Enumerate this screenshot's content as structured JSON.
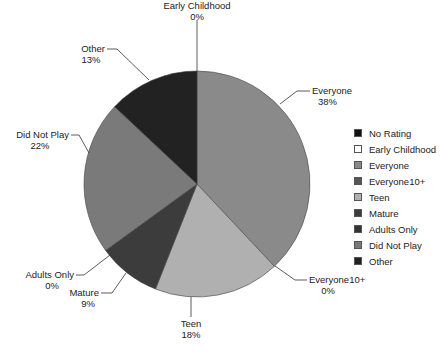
{
  "chart_data": {
    "type": "pie",
    "title": "",
    "categories": [
      "No Rating",
      "Early Childhood",
      "Everyone",
      "Everyone10+",
      "Teen",
      "Mature",
      "Adults Only",
      "Did Not Play",
      "Other"
    ],
    "values": [
      0,
      0,
      38,
      0,
      18,
      9,
      0,
      22,
      13
    ],
    "unit": "%",
    "start_angle": "top (12 o'clock), clockwise",
    "colors": [
      "#111111",
      "#ffffff",
      "#8a8a8a",
      "#555555",
      "#b0b0b0",
      "#3c3c3c",
      "#333333",
      "#7a7a7a",
      "#222222"
    ],
    "legend_position": "right",
    "slice_labels": [
      {
        "name": "Early Childhood",
        "pct": "0%"
      },
      {
        "name": "Everyone",
        "pct": "38%"
      },
      {
        "name": "Everyone10+",
        "pct": "0%"
      },
      {
        "name": "Teen",
        "pct": "18%"
      },
      {
        "name": "Mature",
        "pct": "9%"
      },
      {
        "name": "Adults Only",
        "pct": "0%"
      },
      {
        "name": "Did Not Play",
        "pct": "22%"
      },
      {
        "name": "Other",
        "pct": "13%"
      }
    ]
  },
  "legend": {
    "items": [
      {
        "label": "No Rating",
        "color": "#111111"
      },
      {
        "label": "Early Childhood",
        "color": "#ffffff"
      },
      {
        "label": "Everyone",
        "color": "#8a8a8a"
      },
      {
        "label": "Everyone10+",
        "color": "#555555"
      },
      {
        "label": "Teen",
        "color": "#b0b0b0"
      },
      {
        "label": "Mature",
        "color": "#3c3c3c"
      },
      {
        "label": "Adults Only",
        "color": "#333333"
      },
      {
        "label": "Did Not Play",
        "color": "#7a7a7a"
      },
      {
        "label": "Other",
        "color": "#222222"
      }
    ]
  },
  "labels": {
    "early_childhood": {
      "name": "Early Childhood",
      "pct": "0%"
    },
    "everyone": {
      "name": "Everyone",
      "pct": "38%"
    },
    "everyone10": {
      "name": "Everyone10+",
      "pct": "0%"
    },
    "teen": {
      "name": "Teen",
      "pct": "18%"
    },
    "mature": {
      "name": "Mature",
      "pct": "9%"
    },
    "adults_only": {
      "name": "Adults Only",
      "pct": "0%"
    },
    "did_not_play": {
      "name": "Did Not Play",
      "pct": "22%"
    },
    "other": {
      "name": "Other",
      "pct": "13%"
    }
  }
}
